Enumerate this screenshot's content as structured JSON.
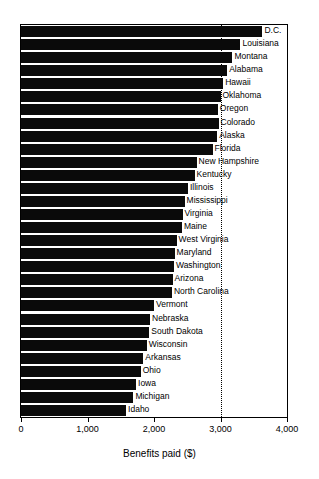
{
  "chart_data": {
    "type": "bar",
    "orientation": "horizontal",
    "title": "",
    "xlabel": "Benefits paid ($)",
    "ylabel": "",
    "xlim": [
      0,
      4000
    ],
    "xticks": [
      0,
      1000,
      2000,
      3000,
      4000
    ],
    "xticklabels": [
      "0",
      "1,000",
      "2,000",
      "3,000",
      "4,000"
    ],
    "grid": "dotted vertical gridline at 3,000",
    "legend": "none",
    "bar_color": "#0a0a0a",
    "categories": [
      "D.C.",
      "Louisiana",
      "Montana",
      "Alabama",
      "Hawaii",
      "Oklahoma",
      "Oregon",
      "Colorado",
      "Alaska",
      "Florida",
      "New Hampshire",
      "Kentucky",
      "Illinois",
      "Mississippi",
      "Virginia",
      "Maine",
      "West Virginia",
      "Maryland",
      "Washington",
      "Arizona",
      "North Carolina",
      "Vermont",
      "Nebraska",
      "South Dakota",
      "Wisconsin",
      "Arkansas",
      "Ohio",
      "Iowa",
      "Michigan",
      "Idaho"
    ],
    "values": [
      3630,
      3300,
      3180,
      3100,
      3040,
      3000,
      2960,
      2970,
      2950,
      2880,
      2640,
      2610,
      2510,
      2460,
      2430,
      2420,
      2340,
      2310,
      2300,
      2280,
      2270,
      2000,
      1940,
      1930,
      1890,
      1840,
      1800,
      1730,
      1690,
      1580
    ]
  }
}
